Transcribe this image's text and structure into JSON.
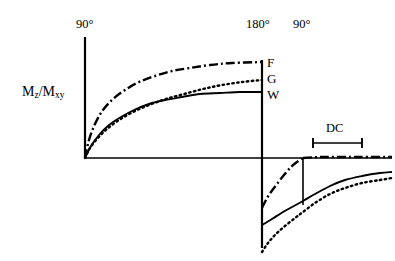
{
  "figure": {
    "title": "",
    "background": "#ffffff",
    "ink": "#000000",
    "width": 395,
    "height": 261
  },
  "axis": {
    "y_axis_label": "M",
    "y_axis_sub1": "z",
    "y_axis_mid": "/M",
    "y_axis_sub2": "xy",
    "y_axis_label_full": "Mz/Mxy",
    "origin_x": 85,
    "baseline_y": 158,
    "y_axis_top": 37,
    "baseline_x_end": 392
  },
  "pulses": [
    {
      "name": "pulse-90-first",
      "label": "90°",
      "x": 85,
      "label_x": 76,
      "label_y": 18,
      "line_top": 37,
      "line_bottom": 158
    },
    {
      "name": "pulse-180",
      "label": "180°",
      "x": 262,
      "label_x": 246,
      "label_y": 18,
      "line_top": 60,
      "line_bottom": 248
    },
    {
      "name": "pulse-90-second",
      "label": "90°",
      "x": 303,
      "label_x": 293,
      "label_y": 18,
      "line_top": 158,
      "line_bottom": 205
    }
  ],
  "curve_labels": [
    {
      "name": "curve-label-f",
      "label": "F",
      "x": 267,
      "y": 56,
      "style": "dash-dot"
    },
    {
      "name": "curve-label-g",
      "label": "G",
      "x": 267,
      "y": 72,
      "style": "dotted"
    },
    {
      "name": "curve-label-w",
      "label": "W",
      "x": 267,
      "y": 88,
      "style": "solid"
    }
  ],
  "span_marker": {
    "name": "dc-span",
    "label": "DC",
    "label_x": 326,
    "label_y": 122,
    "bar_y": 143,
    "bar_x1": 313,
    "bar_x2": 362,
    "cap_half_height": 5
  },
  "chart_data": {
    "type": "line",
    "title": "",
    "xlabel": "",
    "ylabel": "Mz/Mxy",
    "grid": false,
    "legend": "inline-right",
    "series": [
      {
        "name": "F",
        "stroke_style": "dash-dot",
        "dasharray": "9,3,2,3",
        "segments": [
          {
            "phase": "recovery-after-90",
            "points": "85,158 89,140 95,124 103,110 113,99 125,90 139,82 155,76 172,71 190,68 210,65 232,63 262,62"
          },
          {
            "phase": "inverted-recovery",
            "points": "262,208 266,200 271,192 277,184 284,175 291,167 297,162 303,158"
          },
          {
            "phase": "after-second-90",
            "points": "303,158 320,157 340,157 360,157 392,157"
          }
        ]
      },
      {
        "name": "G",
        "stroke_style": "dotted",
        "dasharray": "1.5,3.4",
        "segments": [
          {
            "phase": "recovery-after-90",
            "points": "85,158 90,148 97,139 107,129 119,120 133,112 149,105 166,99 184,94 203,89 222,85 242,82 262,80"
          },
          {
            "phase": "inverted-recovery",
            "points": "262,252 268,243 276,234 285,226 295,218 303,212 315,203 330,194 345,188 362,183 380,180 392,178"
          }
        ]
      },
      {
        "name": "W",
        "stroke_style": "solid",
        "dasharray": "",
        "segments": [
          {
            "phase": "recovery-after-90",
            "points": "85,158 91,146 99,135 109,125 121,117 134,110 149,104 165,100 182,97 200,94 220,93 240,92 262,92"
          },
          {
            "phase": "inverted-recovery",
            "points": "262,225 272,219 283,212 294,206 303,201 315,194 330,186 345,180 362,176 380,173 392,172"
          }
        ]
      }
    ],
    "annotations": [
      {
        "text": "90°",
        "at_x": 85,
        "role": "saturation-pulse"
      },
      {
        "text": "180°",
        "at_x": 262,
        "role": "inversion-pulse"
      },
      {
        "text": "90°",
        "at_x": 303,
        "role": "read-pulse"
      },
      {
        "text": "DC",
        "at_x": 337,
        "role": "dynamic-contrast-window"
      }
    ]
  }
}
